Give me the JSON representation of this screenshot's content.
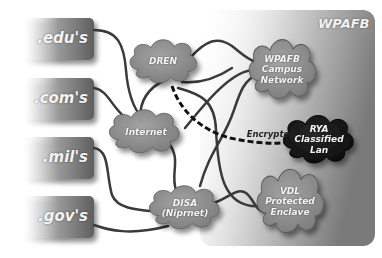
{
  "region": {
    "label": "WPAFB"
  },
  "sources": [
    {
      "id": "edu",
      "label": ".edu's"
    },
    {
      "id": "com",
      "label": ".com's"
    },
    {
      "id": "mil",
      "label": ".mil's"
    },
    {
      "id": "gov",
      "label": ".gov's"
    }
  ],
  "clouds": [
    {
      "id": "dren",
      "label": "DREN"
    },
    {
      "id": "internet",
      "label": "Internet"
    },
    {
      "id": "disa",
      "label_line1": "DISA",
      "label_line2": "(Niprnet)"
    },
    {
      "id": "campus",
      "label_line1": "WPAFB",
      "label_line2": "Campus",
      "label_line3": "Network"
    },
    {
      "id": "rya",
      "label_line1": "RYA",
      "label_line2": "Classified",
      "label_line3": "Lan"
    },
    {
      "id": "vdl",
      "label_line1": "VDL",
      "label_line2": "Protected",
      "label_line3": "Enclave"
    }
  ],
  "links": {
    "encrypted_label": "Encrypted"
  },
  "colors": {
    "box_gray": "#6e6e6e",
    "cloud_gray": "#8a8a8a",
    "cloud_dark": "#1a1a1a",
    "line": "#3a3a3a",
    "region_bg": "#9a9a9a"
  }
}
